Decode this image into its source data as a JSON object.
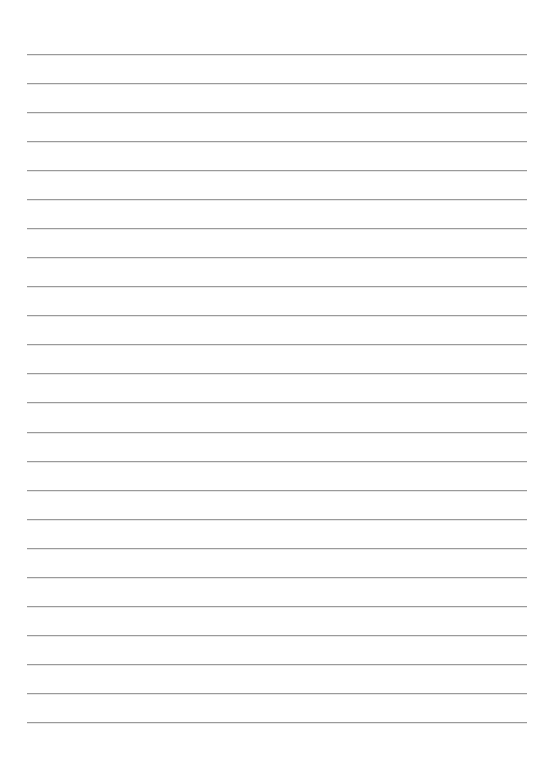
{
  "page": {
    "type": "lined-paper",
    "background": "#ffffff",
    "rule_color": "#9a9a9a",
    "rule_count": 24,
    "first_rule_y": 54,
    "rule_spacing": 29.04,
    "rule_left": 27,
    "rule_right": 527
  }
}
